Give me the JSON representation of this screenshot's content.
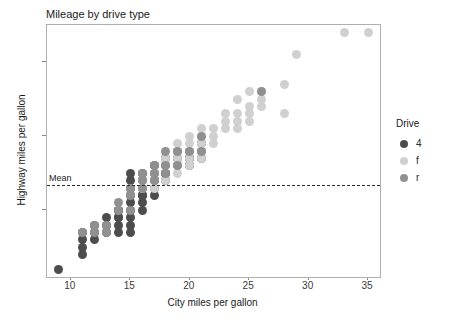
{
  "chart_data": {
    "type": "scatter",
    "title": "Mileage by drive type",
    "xlabel": "City miles per gallon",
    "ylabel": "Highway miles per gallon",
    "xlim": [
      8,
      36
    ],
    "ylim": [
      11,
      45
    ],
    "xticks": [
      10,
      15,
      20,
      25,
      30,
      35
    ],
    "yticks": [
      20,
      30,
      40
    ],
    "grid": false,
    "legend": {
      "title": "Drive",
      "position": "right",
      "entries": [
        {
          "label": "4",
          "color": "#4d4d4d"
        },
        {
          "label": "f",
          "color": "#d0d0d0"
        },
        {
          "label": "r",
          "color": "#909090"
        }
      ]
    },
    "annotations": [
      {
        "type": "hline",
        "label": "Mean",
        "y": 23.44,
        "style": "dashed",
        "color": "#2b2b2b"
      }
    ],
    "series": [
      {
        "name": "4",
        "color": "#4d4d4d",
        "points": [
          [
            9,
            12
          ],
          [
            11,
            14
          ],
          [
            11,
            15
          ],
          [
            11,
            16
          ],
          [
            11,
            17
          ],
          [
            12,
            16
          ],
          [
            12,
            17
          ],
          [
            12,
            18
          ],
          [
            13,
            17
          ],
          [
            13,
            18
          ],
          [
            13,
            19
          ],
          [
            14,
            17
          ],
          [
            14,
            18
          ],
          [
            14,
            19
          ],
          [
            14,
            20
          ],
          [
            15,
            17
          ],
          [
            15,
            18
          ],
          [
            15,
            19
          ],
          [
            15,
            20
          ],
          [
            15,
            21
          ],
          [
            15,
            22
          ],
          [
            15,
            23
          ],
          [
            15,
            24
          ],
          [
            15,
            25
          ],
          [
            16,
            20
          ],
          [
            16,
            21
          ],
          [
            16,
            22
          ],
          [
            16,
            23
          ],
          [
            16,
            24
          ],
          [
            16,
            25
          ],
          [
            17,
            22
          ],
          [
            17,
            23
          ],
          [
            17,
            24
          ],
          [
            17,
            25
          ],
          [
            17,
            26
          ],
          [
            18,
            24
          ],
          [
            18,
            25
          ],
          [
            18,
            26
          ],
          [
            18,
            27
          ],
          [
            19,
            26
          ],
          [
            19,
            27
          ],
          [
            19,
            28
          ],
          [
            20,
            26
          ],
          [
            20,
            27
          ],
          [
            20,
            28
          ],
          [
            21,
            27
          ],
          [
            21,
            28
          ],
          [
            21,
            29
          ],
          [
            14,
            19
          ],
          [
            14,
            20
          ],
          [
            16,
            22
          ],
          [
            17,
            24
          ],
          [
            18,
            25
          ],
          [
            20,
            27
          ]
        ]
      },
      {
        "name": "f",
        "color": "#d0d0d0",
        "points": [
          [
            16,
            23
          ],
          [
            16,
            24
          ],
          [
            17,
            23
          ],
          [
            17,
            24
          ],
          [
            17,
            25
          ],
          [
            18,
            24
          ],
          [
            18,
            26
          ],
          [
            18,
            27
          ],
          [
            19,
            25
          ],
          [
            19,
            26
          ],
          [
            19,
            27
          ],
          [
            19,
            28
          ],
          [
            19,
            29
          ],
          [
            20,
            26
          ],
          [
            20,
            27
          ],
          [
            20,
            28
          ],
          [
            20,
            29
          ],
          [
            20,
            30
          ],
          [
            21,
            27
          ],
          [
            21,
            28
          ],
          [
            21,
            29
          ],
          [
            21,
            30
          ],
          [
            21,
            31
          ],
          [
            22,
            29
          ],
          [
            22,
            30
          ],
          [
            22,
            31
          ],
          [
            23,
            31
          ],
          [
            23,
            32
          ],
          [
            23,
            33
          ],
          [
            24,
            31
          ],
          [
            24,
            32
          ],
          [
            24,
            33
          ],
          [
            25,
            32
          ],
          [
            25,
            33
          ],
          [
            25,
            34
          ],
          [
            26,
            34
          ],
          [
            26,
            35
          ],
          [
            28,
            37
          ],
          [
            29,
            41
          ],
          [
            33,
            44
          ],
          [
            35,
            44
          ],
          [
            24,
            35
          ],
          [
            25,
            36
          ],
          [
            26,
            36
          ],
          [
            28,
            33
          ]
        ]
      },
      {
        "name": "r",
        "color": "#909090",
        "points": [
          [
            11,
            17
          ],
          [
            12,
            17
          ],
          [
            12,
            18
          ],
          [
            13,
            17
          ],
          [
            13,
            18
          ],
          [
            14,
            20
          ],
          [
            14,
            21
          ],
          [
            15,
            20
          ],
          [
            15,
            22
          ],
          [
            15,
            23
          ],
          [
            16,
            23
          ],
          [
            16,
            24
          ],
          [
            16,
            25
          ],
          [
            17,
            24
          ],
          [
            17,
            25
          ],
          [
            17,
            26
          ],
          [
            18,
            25
          ],
          [
            18,
            26
          ],
          [
            18,
            28
          ],
          [
            19,
            26
          ],
          [
            19,
            28
          ],
          [
            20,
            28
          ],
          [
            21,
            28
          ],
          [
            21,
            30
          ],
          [
            26,
            36
          ]
        ]
      }
    ]
  }
}
